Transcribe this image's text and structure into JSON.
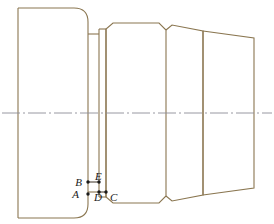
{
  "drawing": {
    "title": "Stepped shaft orthographic section view",
    "type": "engineering-line-drawing",
    "canvas": {
      "width": 274,
      "height": 224
    },
    "colors": {
      "outline": "#8a7650",
      "outline_dark": "#6b5c3e",
      "centerline": "#8c8c96",
      "label": "#1a1a1a",
      "background": "#ffffff"
    },
    "stroke_widths": {
      "outline": 1.1,
      "centerline": 0.8
    },
    "axis": {
      "name": "centerline",
      "y": 113,
      "x_start": 2,
      "x_end": 272,
      "dash_pattern": "18 3 2 3"
    },
    "sections": [
      {
        "name": "flange-left",
        "x_left": 18,
        "x_right": 88,
        "y_top": 8,
        "y_bottom": 218,
        "corner_style": "rounded-right",
        "corner_radius": 14
      },
      {
        "name": "neck-groove",
        "x_left": 88,
        "x_right": 99,
        "y_top": 34,
        "y_bottom": 192
      },
      {
        "name": "collar-thin",
        "x_left": 99,
        "x_right": 106,
        "y_top": 29,
        "y_bottom": 197
      },
      {
        "name": "body-main",
        "x_left": 106,
        "x_right": 166,
        "y_top": 23,
        "y_bottom": 203,
        "corner_style": "chamfered",
        "chamfer": 7
      },
      {
        "name": "shoulder-mid",
        "x_left": 166,
        "x_right": 203,
        "y_top": 31,
        "y_bottom": 195,
        "corner_style": "chamfered",
        "chamfer": 6
      },
      {
        "name": "taper-right",
        "x_left": 203,
        "x_right": 254,
        "y_top_left": 31,
        "y_bottom_left": 195,
        "y_top_right": 38,
        "y_bottom_right": 188,
        "shape": "trapezoid-tapered"
      }
    ],
    "points": [
      {
        "id": "A",
        "label": "A",
        "x": 88,
        "y": 194,
        "label_x": 79,
        "label_y": 198,
        "marker": "dot"
      },
      {
        "id": "B",
        "label": "B",
        "x": 88,
        "y": 182,
        "label_x": 77,
        "label_y": 185,
        "marker": "dot"
      },
      {
        "id": "C",
        "label": "C",
        "x": 106,
        "y": 192,
        "label_x": 110,
        "label_y": 200,
        "marker": "dot"
      },
      {
        "id": "D",
        "label": "D",
        "x": 99,
        "y": 192,
        "label_x": 93,
        "label_y": 200,
        "marker": "dot"
      },
      {
        "id": "E",
        "label": "E",
        "x": 99,
        "y": 182,
        "label_x": 96,
        "label_y": 179,
        "marker": "dot"
      }
    ],
    "point_links": [
      {
        "name": "segment-B-E",
        "from": "B",
        "to": "E"
      },
      {
        "name": "segment-D-C",
        "from": "D",
        "to": "C"
      }
    ],
    "marker_radius": 1.7
  }
}
